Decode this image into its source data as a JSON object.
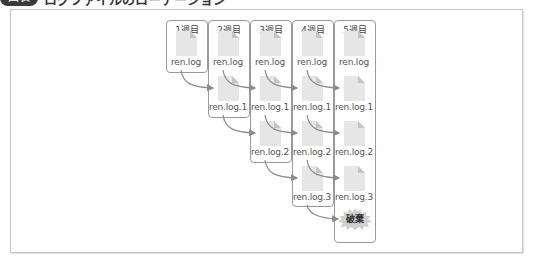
{
  "heading": {
    "badge": "図表",
    "title": "ログファイルのローテーション"
  },
  "weeks": [
    {
      "label": "1週目",
      "files": [
        "ren.log"
      ]
    },
    {
      "label": "2週目",
      "files": [
        "ren.log",
        "ren.log.1"
      ]
    },
    {
      "label": "3週目",
      "files": [
        "ren.log",
        "ren.log.1",
        "ren.log.2"
      ]
    },
    {
      "label": "4週目",
      "files": [
        "ren.log",
        "ren.log.1",
        "ren.log.2",
        "ren.log.3"
      ]
    },
    {
      "label": "5週目",
      "files": [
        "ren.log",
        "ren.log.1",
        "ren.log.2",
        "ren.log.3"
      ]
    }
  ],
  "discard_label": "破棄",
  "colors": {
    "box_border": "#9a9a9a",
    "arrow": "#8c8c8c",
    "file_fill": "#e6e6e6",
    "burst_fill": "#cfcfcf"
  }
}
